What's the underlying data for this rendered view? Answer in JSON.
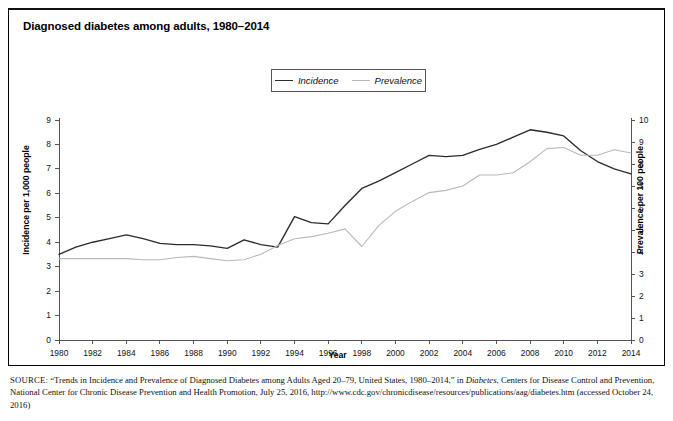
{
  "figure": {
    "title": "Diagnosed diabetes among adults, 1980–2014"
  },
  "legend": {
    "position": "top-center",
    "entries": [
      {
        "label": "Incidence",
        "color": "#2b2b33",
        "style": "solid"
      },
      {
        "label": "Prevalence",
        "color": "#b9b9bd",
        "style": "solid-light"
      }
    ]
  },
  "axes": {
    "x": {
      "title": "Year",
      "ticks": [
        "1980",
        "1982",
        "1984",
        "1986",
        "1988",
        "1990",
        "1992",
        "1994",
        "1996",
        "1998",
        "2000",
        "2002",
        "2004",
        "2006",
        "2008",
        "2010",
        "2012",
        "2014"
      ],
      "range": [
        1980,
        2014
      ]
    },
    "y_left": {
      "title": "Incidence per 1,000 people",
      "ticks": [
        "0",
        "1",
        "2",
        "3",
        "4",
        "5",
        "6",
        "7",
        "8",
        "9"
      ],
      "range": [
        0,
        9
      ]
    },
    "y_right": {
      "title": "Prevalence per 100 people",
      "ticks": [
        "0",
        "1",
        "2",
        "3",
        "4",
        "5",
        "6",
        "7",
        "8",
        "9",
        "10"
      ],
      "range": [
        0,
        10
      ]
    }
  },
  "source": {
    "label": "SOURCE:",
    "text_part1": " “Trends in Incidence and Prevalence of Diagnosed Diabetes among Adults Aged 20–79, United States, 1980–2014,” in ",
    "italic1": "Diabetes",
    "text_part2": ", Centers for Disease Control and Prevention, National Center for Chronic Disease Prevention and Health Promotion, July 25, 2016, http://www.cdc.gov/chronicdisease/resources/publications/aag/diabetes.htm (accessed October 24, 2016)"
  },
  "chart_data": {
    "type": "line",
    "title": "Diagnosed diabetes among adults, 1980–2014",
    "xlabel": "Year",
    "ylabel": "Incidence per 1,000 people",
    "y2label": "Prevalence per 100 people",
    "xlim": [
      1980,
      2014
    ],
    "ylim": [
      0,
      9
    ],
    "y2lim": [
      0,
      10
    ],
    "grid": false,
    "legend_position": "top-center",
    "x": [
      1980,
      1981,
      1982,
      1983,
      1984,
      1985,
      1986,
      1987,
      1988,
      1989,
      1990,
      1991,
      1992,
      1993,
      1994,
      1995,
      1996,
      1997,
      1998,
      1999,
      2000,
      2001,
      2002,
      2003,
      2004,
      2005,
      2006,
      2007,
      2008,
      2009,
      2010,
      2011,
      2012,
      2013,
      2014
    ],
    "series": [
      {
        "name": "Incidence",
        "axis": "left",
        "units": "per 1,000 people",
        "color": "#2b2b33",
        "values": [
          3.5,
          3.8,
          4.0,
          4.15,
          4.3,
          4.15,
          3.95,
          3.9,
          3.9,
          3.85,
          3.75,
          4.1,
          3.9,
          3.8,
          5.05,
          4.8,
          4.75,
          5.5,
          6.2,
          6.5,
          6.85,
          7.2,
          7.55,
          7.5,
          7.55,
          7.8,
          8.0,
          8.3,
          8.6,
          8.5,
          8.35,
          7.75,
          7.3,
          7.0,
          6.8
        ]
      },
      {
        "name": "Prevalence",
        "axis": "right",
        "units": "per 100 people",
        "color": "#b9b9bd",
        "values": [
          3.7,
          3.7,
          3.7,
          3.7,
          3.7,
          3.65,
          3.65,
          3.75,
          3.8,
          3.7,
          3.6,
          3.65,
          3.9,
          4.3,
          4.6,
          4.7,
          4.85,
          5.05,
          4.25,
          5.2,
          5.85,
          6.3,
          6.7,
          6.8,
          7.0,
          7.5,
          7.5,
          7.6,
          8.1,
          8.7,
          8.75,
          8.4,
          8.4,
          8.65,
          8.5
        ]
      }
    ]
  }
}
